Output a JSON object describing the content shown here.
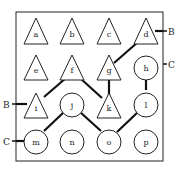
{
  "diagram": {
    "nodes": [
      {
        "id": "a",
        "shape": "triangle",
        "label": "a"
      },
      {
        "id": "b",
        "shape": "triangle",
        "label": "b"
      },
      {
        "id": "c",
        "shape": "triangle",
        "label": "c"
      },
      {
        "id": "d",
        "shape": "triangle",
        "label": "d"
      },
      {
        "id": "e",
        "shape": "triangle",
        "label": "e"
      },
      {
        "id": "f",
        "shape": "triangle",
        "label": "f"
      },
      {
        "id": "g",
        "shape": "triangle",
        "label": "g"
      },
      {
        "id": "h",
        "shape": "circle",
        "label": "h"
      },
      {
        "id": "i",
        "shape": "triangle",
        "label": "i"
      },
      {
        "id": "j",
        "shape": "circle",
        "label": "j"
      },
      {
        "id": "k",
        "shape": "triangle",
        "label": "k"
      },
      {
        "id": "l",
        "shape": "circle",
        "label": "l"
      },
      {
        "id": "m",
        "shape": "circle",
        "label": "m"
      },
      {
        "id": "n",
        "shape": "circle",
        "label": "n"
      },
      {
        "id": "o",
        "shape": "circle",
        "label": "o"
      },
      {
        "id": "p",
        "shape": "circle",
        "label": "p"
      }
    ],
    "edges": [
      [
        "d",
        "g"
      ],
      [
        "g",
        "k"
      ],
      [
        "f",
        "i"
      ],
      [
        "f",
        "k"
      ],
      [
        "h",
        "l"
      ],
      [
        "j",
        "m"
      ],
      [
        "j",
        "o"
      ],
      [
        "o",
        "l"
      ]
    ],
    "external_labels": {
      "right_top": "B",
      "right_mid": "C",
      "left_mid": "B",
      "left_bottom": "C"
    }
  }
}
